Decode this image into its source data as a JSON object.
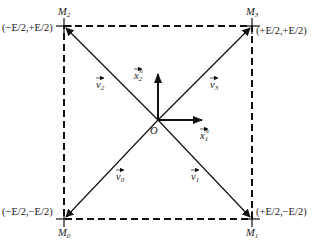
{
  "diagram": {
    "type": "space-vector-square",
    "origin_label": "O",
    "corners": [
      {
        "id": "M0",
        "name": "M",
        "sub": "0",
        "coord": "(−E/2,−E/2)"
      },
      {
        "id": "M1",
        "name": "M",
        "sub": "1",
        "coord": "(+E/2,−E/2)"
      },
      {
        "id": "M2",
        "name": "M",
        "sub": "2",
        "coord": "(−E/2,+E/2)"
      },
      {
        "id": "M3",
        "name": "M",
        "sub": "3",
        "coord": "(+E/2,+E/2)"
      }
    ],
    "vectors": [
      {
        "id": "v0",
        "name": "v",
        "sub": "0",
        "to": "M0"
      },
      {
        "id": "v1",
        "name": "v",
        "sub": "1",
        "to": "M1"
      },
      {
        "id": "v2",
        "name": "v",
        "sub": "2",
        "to": "M2"
      },
      {
        "id": "v3",
        "name": "v",
        "sub": "3",
        "to": "M3"
      }
    ],
    "axes": [
      {
        "id": "x1",
        "name": "x",
        "sub": "1",
        "sup": "n",
        "direction": "horizontal"
      },
      {
        "id": "x2",
        "name": "x",
        "sub": "2",
        "sup": "n",
        "direction": "vertical"
      }
    ],
    "colors": {
      "stroke": "#111111",
      "background": "#ffffff"
    }
  }
}
